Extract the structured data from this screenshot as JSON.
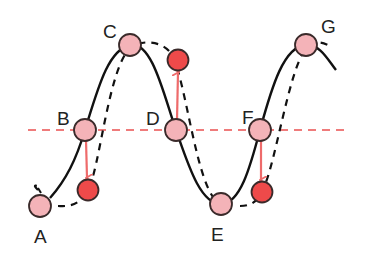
{
  "diagram": {
    "type": "wave-particle-displacement",
    "colors": {
      "wave_solid": "#111111",
      "wave_dashed": "#111111",
      "equilibrium_line": "#ef7b7b",
      "particle_fill": "#f4b3b8",
      "particle_stroke": "#3a2a2a",
      "displaced_particle_fill": "#ee4a4a",
      "arrow": "#ee6b6b"
    },
    "points": [
      {
        "label": "A",
        "x": 40,
        "y": 206,
        "label_x": 34,
        "label_y": 243
      },
      {
        "label": "B",
        "x": 85,
        "y": 130,
        "label_x": 57,
        "label_y": 125
      },
      {
        "label": "C",
        "x": 130,
        "y": 45,
        "label_x": 103,
        "label_y": 38
      },
      {
        "label": "D",
        "x": 176,
        "y": 130,
        "label_x": 146,
        "label_y": 125
      },
      {
        "label": "E",
        "x": 221,
        "y": 204,
        "label_x": 211,
        "label_y": 241
      },
      {
        "label": "F",
        "x": 260,
        "y": 130,
        "label_x": 242,
        "label_y": 124
      },
      {
        "label": "G",
        "x": 306,
        "y": 45,
        "label_x": 321,
        "label_y": 33
      }
    ],
    "displaced_particles": [
      {
        "from": "B",
        "x": 88,
        "y": 190,
        "direction": "down"
      },
      {
        "from": "D",
        "x": 178,
        "y": 60,
        "direction": "up"
      },
      {
        "from": "F",
        "x": 262,
        "y": 192,
        "direction": "down"
      }
    ],
    "equilibrium_line": {
      "y": 130,
      "x_start": 28,
      "x_end": 345
    }
  }
}
